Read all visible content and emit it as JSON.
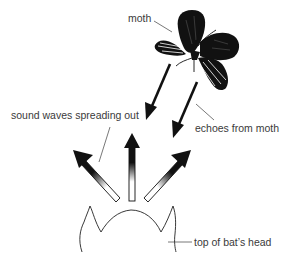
{
  "diagram": {
    "labels": {
      "moth": "moth",
      "sound_waves": "sound waves spreading out",
      "echoes": "echoes from moth",
      "bat_head": "top of bat’s head"
    },
    "elements": {
      "emitted_arrows": 3,
      "echo_arrows": 2
    },
    "colors": {
      "ink": "#111111",
      "text": "#3a3a3a",
      "background": "#ffffff"
    }
  }
}
